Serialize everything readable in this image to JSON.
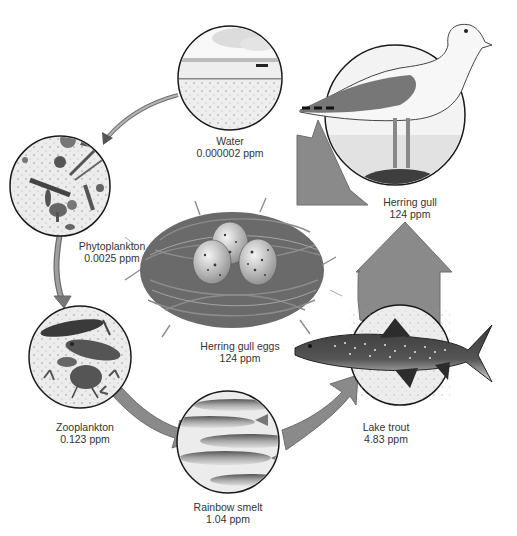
{
  "diagram": {
    "type": "biomagnification-food-chain",
    "colors": {
      "arrow_fill": "#8a8a8a",
      "arrow_stroke": "#6e6e6e",
      "circle_border": "#1a1a1a",
      "circle_fill": "#f0f0f0",
      "text": "#333333"
    },
    "nodes": [
      {
        "id": "water",
        "name": "Water",
        "value": "0.000002 ppm"
      },
      {
        "id": "phytoplankton",
        "name": "Phytoplankton",
        "value": "0.0025 ppm"
      },
      {
        "id": "zooplankton",
        "name": "Zooplankton",
        "value": "0.123 ppm"
      },
      {
        "id": "rainbow-smelt",
        "name": "Rainbow smelt",
        "value": "1.04 ppm"
      },
      {
        "id": "lake-trout",
        "name": "Lake trout",
        "value": "4.83 ppm"
      },
      {
        "id": "herring-gull",
        "name": "Herring gull",
        "value": "124 ppm"
      },
      {
        "id": "herring-gull-eggs",
        "name": "Herring gull eggs",
        "value": "124 ppm"
      }
    ],
    "edges": [
      {
        "from": "water",
        "to": "phytoplankton"
      },
      {
        "from": "phytoplankton",
        "to": "zooplankton"
      },
      {
        "from": "zooplankton",
        "to": "rainbow-smelt"
      },
      {
        "from": "rainbow-smelt",
        "to": "lake-trout"
      },
      {
        "from": "lake-trout",
        "to": "herring-gull"
      },
      {
        "from": "herring-gull",
        "to": "herring-gull-eggs"
      }
    ]
  }
}
